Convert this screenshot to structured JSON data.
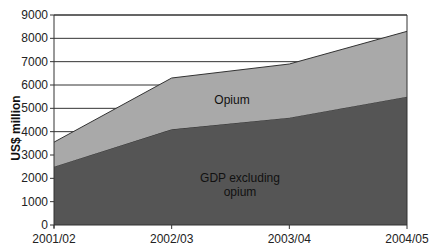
{
  "chart_data": {
    "type": "area",
    "stacked": true,
    "title": "",
    "xlabel": "",
    "ylabel": "US$ million",
    "categories": [
      "2001/02",
      "2002/03",
      "2003/04",
      "2004/05"
    ],
    "series": [
      {
        "name": "GDP excluding opium",
        "label_lines": [
          "GDP excluding",
          "opium"
        ],
        "values": [
          2500,
          4100,
          4600,
          5500
        ],
        "color": "#555555"
      },
      {
        "name": "Opium",
        "label_lines": [
          "Opium"
        ],
        "values": [
          1050,
          2200,
          2300,
          2800
        ],
        "color": "#a9a9a9"
      }
    ],
    "stacked_totals": [
      3550,
      6300,
      6900,
      8300
    ],
    "ylim": [
      0,
      9000
    ],
    "yticks": [
      0,
      1000,
      2000,
      3000,
      4000,
      5000,
      6000,
      7000,
      8000,
      9000
    ],
    "grid": true,
    "legend": "inline-labels"
  }
}
